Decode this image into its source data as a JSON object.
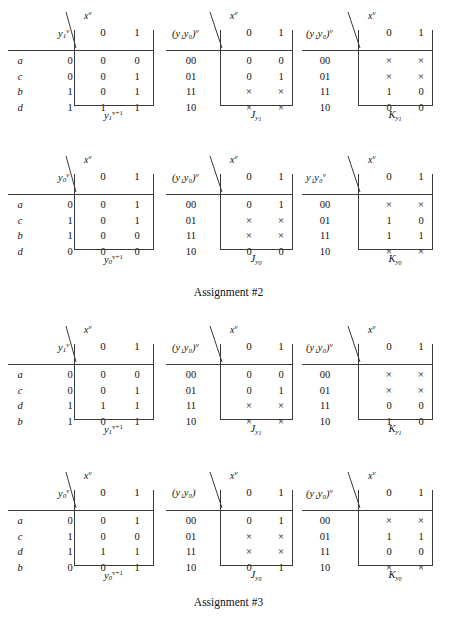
{
  "page": {
    "assignments": [
      {
        "caption": "Assignment #2"
      },
      {
        "caption": "Assignment #3"
      }
    ]
  },
  "labels": {
    "input_var": "x",
    "input_var_sup": "v",
    "col0": "0",
    "col1": "1"
  },
  "tables": [
    {
      "id": "a2-y1-next",
      "state_label": "y",
      "state_sub": "1",
      "state_sup": "v",
      "state_paren": false,
      "rowlabels": [
        "a",
        "c",
        "b",
        "d"
      ],
      "states": [
        "0",
        "0",
        "1",
        "1"
      ],
      "cells": [
        [
          "0",
          "0"
        ],
        [
          "0",
          "1"
        ],
        [
          "0",
          "1"
        ],
        [
          "1",
          "1"
        ]
      ],
      "caption": "y",
      "caption_sub": "1",
      "caption_sup": "v+1",
      "caption_kind": "next"
    },
    {
      "id": "a2-J-y1",
      "state_label": "y₁y₀",
      "state_sub": "",
      "state_sup": "v",
      "state_paren": true,
      "rowlabels": [
        "00",
        "01",
        "11",
        "10"
      ],
      "states": [
        "",
        "",
        "",
        ""
      ],
      "cells": [
        [
          "0",
          "0"
        ],
        [
          "0",
          "1"
        ],
        [
          "×",
          "×"
        ],
        [
          "×",
          "×"
        ]
      ],
      "caption": "J",
      "caption_sub": "y1",
      "caption_sup": "",
      "caption_kind": "JK"
    },
    {
      "id": "a2-K-y1",
      "state_label": "y₁y₀",
      "state_sub": "",
      "state_sup": "v",
      "state_paren": true,
      "rowlabels": [
        "00",
        "01",
        "11",
        "10"
      ],
      "states": [
        "",
        "",
        "",
        ""
      ],
      "cells": [
        [
          "×",
          "×"
        ],
        [
          "×",
          "×"
        ],
        [
          "1",
          "0"
        ],
        [
          "0",
          "0"
        ]
      ],
      "caption": "K",
      "caption_sub": "y1",
      "caption_sup": "",
      "caption_kind": "JK"
    },
    {
      "id": "a2-y0-next",
      "state_label": "y",
      "state_sub": "0",
      "state_sup": "v",
      "state_paren": false,
      "rowlabels": [
        "a",
        "c",
        "b",
        "d"
      ],
      "states": [
        "0",
        "1",
        "1",
        "0"
      ],
      "cells": [
        [
          "0",
          "1"
        ],
        [
          "0",
          "1"
        ],
        [
          "0",
          "0"
        ],
        [
          "0",
          "0"
        ]
      ],
      "caption": "y",
      "caption_sub": "0",
      "caption_sup": "v+1",
      "caption_kind": "next"
    },
    {
      "id": "a2-J-y0",
      "state_label": "y₁y₀",
      "state_sub": "",
      "state_sup": "v",
      "state_paren": true,
      "rowlabels": [
        "00",
        "01",
        "11",
        "10"
      ],
      "states": [
        "",
        "",
        "",
        ""
      ],
      "cells": [
        [
          "0",
          "1"
        ],
        [
          "×",
          "×"
        ],
        [
          "×",
          "×"
        ],
        [
          "0",
          "0"
        ]
      ],
      "caption": "J",
      "caption_sub": "y0",
      "caption_sup": "",
      "caption_kind": "JK"
    },
    {
      "id": "a2-K-y0",
      "state_label": "y₁y₀",
      "state_sub": "",
      "state_sup": "v",
      "state_paren": false,
      "rowlabels": [
        "00",
        "01",
        "11",
        "10"
      ],
      "states": [
        "",
        "",
        "",
        ""
      ],
      "cells": [
        [
          "×",
          "×"
        ],
        [
          "1",
          "0"
        ],
        [
          "1",
          "1"
        ],
        [
          "×",
          "×"
        ]
      ],
      "caption": "K",
      "caption_sub": "y0",
      "caption_sup": "",
      "caption_kind": "JK"
    },
    {
      "id": "a3-y1-next",
      "state_label": "y",
      "state_sub": "1",
      "state_sup": "v",
      "state_paren": false,
      "rowlabels": [
        "a",
        "c",
        "d",
        "b"
      ],
      "states": [
        "0",
        "0",
        "1",
        "1"
      ],
      "cells": [
        [
          "0",
          "0"
        ],
        [
          "0",
          "1"
        ],
        [
          "1",
          "1"
        ],
        [
          "0",
          "1"
        ]
      ],
      "caption": "y",
      "caption_sub": "1",
      "caption_sup": "v+1",
      "caption_kind": "next"
    },
    {
      "id": "a3-J-y1",
      "state_label": "y₁y₀",
      "state_sub": "",
      "state_sup": "v",
      "state_paren": true,
      "rowlabels": [
        "00",
        "01",
        "11",
        "10"
      ],
      "states": [
        "",
        "",
        "",
        ""
      ],
      "cells": [
        [
          "0",
          "0"
        ],
        [
          "0",
          "1"
        ],
        [
          "×",
          "×"
        ],
        [
          "×",
          "×"
        ]
      ],
      "caption": "J",
      "caption_sub": "y1",
      "caption_sup": "",
      "caption_kind": "JK"
    },
    {
      "id": "a3-K-y1",
      "state_label": "y₁y₀",
      "state_sub": "",
      "state_sup": "v",
      "state_paren": true,
      "rowlabels": [
        "00",
        "01",
        "11",
        "10"
      ],
      "states": [
        "",
        "",
        "",
        ""
      ],
      "cells": [
        [
          "×",
          "×"
        ],
        [
          "×",
          "×"
        ],
        [
          "0",
          "0"
        ],
        [
          "1",
          "0"
        ]
      ],
      "caption": "K",
      "caption_sub": "y1",
      "caption_sup": "",
      "caption_kind": "JK"
    },
    {
      "id": "a3-y0-next",
      "state_label": "y",
      "state_sub": "0",
      "state_sup": "v",
      "state_paren": false,
      "rowlabels": [
        "a",
        "c",
        "d",
        "b"
      ],
      "states": [
        "0",
        "1",
        "1",
        "0"
      ],
      "cells": [
        [
          "0",
          "1"
        ],
        [
          "0",
          "0"
        ],
        [
          "1",
          "1"
        ],
        [
          "0",
          "1"
        ]
      ],
      "caption": "y",
      "caption_sub": "0",
      "caption_sup": "v+1",
      "caption_kind": "next"
    },
    {
      "id": "a3-J-y0",
      "state_label": "y₁y₀",
      "state_sub": "",
      "state_sup": "",
      "state_paren": true,
      "rowlabels": [
        "00",
        "01",
        "11",
        "10"
      ],
      "states": [
        "",
        "",
        "",
        ""
      ],
      "cells": [
        [
          "0",
          "1"
        ],
        [
          "×",
          "×"
        ],
        [
          "×",
          "×"
        ],
        [
          "0",
          "1"
        ]
      ],
      "caption": "J",
      "caption_sub": "y0",
      "caption_sup": "",
      "caption_kind": "JK"
    },
    {
      "id": "a3-K-y0",
      "state_label": "y₁y₀",
      "state_sub": "",
      "state_sup": "v",
      "state_paren": true,
      "rowlabels": [
        "00",
        "01",
        "11",
        "10"
      ],
      "states": [
        "",
        "",
        "",
        ""
      ],
      "cells": [
        [
          "×",
          "×"
        ],
        [
          "1",
          "1"
        ],
        [
          "0",
          "0"
        ],
        [
          "×",
          "×"
        ]
      ],
      "caption": "K",
      "caption_sub": "y0",
      "caption_sup": "",
      "caption_kind": "JK"
    }
  ],
  "layout": {
    "columns_x": [
      8,
      166,
      302
    ],
    "rows_y": [
      8,
      152,
      322,
      468
    ],
    "assign_y": [
      286,
      596
    ]
  }
}
